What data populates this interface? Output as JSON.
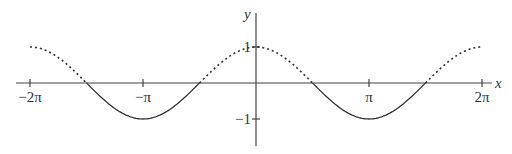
{
  "chart_data": {
    "type": "line",
    "title": "",
    "xlabel": "x",
    "ylabel": "y",
    "xlim": [
      -6.5,
      6.6
    ],
    "ylim": [
      -1.7,
      1.95
    ],
    "x_ticks": [
      {
        "value": -6.283185,
        "label": "−2π"
      },
      {
        "value": -3.141593,
        "label": "−π"
      },
      {
        "value": 3.141593,
        "label": "π"
      },
      {
        "value": 6.283185,
        "label": "2π"
      }
    ],
    "y_ticks": [
      {
        "value": 1,
        "label": "1"
      },
      {
        "value": -1,
        "label": "−1"
      }
    ],
    "series": [
      {
        "name": "y = cos x (dotted where cos x ≥ 0)",
        "style": "dotted",
        "function": "cos(x)",
        "domain": [
          -6.283185,
          6.283185
        ],
        "segments": [
          [
            -6.283185,
            -4.712389
          ],
          [
            -1.570796,
            1.570796
          ],
          [
            4.712389,
            6.283185
          ]
        ]
      },
      {
        "name": "y = cos x (solid where cos x < 0)",
        "style": "solid",
        "function": "cos(x)",
        "segments": [
          [
            -4.712389,
            -1.570796
          ],
          [
            1.570796,
            4.712389
          ]
        ]
      }
    ],
    "key_points": [
      {
        "x": -6.283185,
        "y": 1
      },
      {
        "x": -4.712389,
        "y": 0
      },
      {
        "x": -3.141593,
        "y": -1
      },
      {
        "x": -1.570796,
        "y": 0
      },
      {
        "x": 0,
        "y": 1
      },
      {
        "x": 1.570796,
        "y": 0
      },
      {
        "x": 3.141593,
        "y": -1
      },
      {
        "x": 4.712389,
        "y": 0
      },
      {
        "x": 6.283185,
        "y": 1
      }
    ],
    "grid": false,
    "legend": null
  },
  "layout": {
    "origin_px": [
      256,
      83
    ],
    "px_per_pi": 113,
    "px_per_unit_y": 36,
    "x_axis_px": [
      16,
      492
    ],
    "y_axis_px": [
      13,
      146
    ],
    "line_color": "#333333"
  }
}
